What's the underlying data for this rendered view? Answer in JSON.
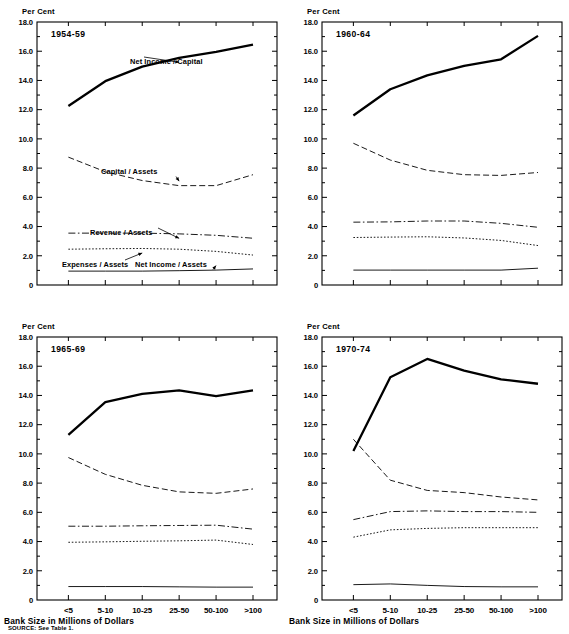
{
  "figure": {
    "axis_unit_label": "Per Cent",
    "x_axis_title": "Bank Size in Millions of Dollars",
    "source_note": "SOURCE: See Table 1."
  },
  "chart_data": [
    {
      "type": "line",
      "title": "1954-59",
      "xlabel": "Bank Size in Millions of Dollars",
      "ylabel": "Per Cent",
      "categories": [
        "<5",
        "5-10",
        "10-25",
        "25-50",
        "50-100",
        ">100"
      ],
      "ylim": [
        0,
        18
      ],
      "yticks": [
        "0",
        "2.0",
        "4.0",
        "6.0",
        "8.0",
        "10.0",
        "12.0",
        "14.0",
        "16.0",
        "18.0"
      ],
      "grid": false,
      "legend": "inline-annotations",
      "series": [
        {
          "name": "Net Income / Capital",
          "style": "solid-thick",
          "values": [
            12.25,
            13.95,
            14.95,
            15.55,
            15.95,
            16.45
          ]
        },
        {
          "name": "Capital / Assets",
          "style": "dashed",
          "values": [
            8.75,
            7.75,
            7.15,
            6.8,
            6.8,
            7.55
          ]
        },
        {
          "name": "Revenue / Assets",
          "style": "dash-dot",
          "values": [
            3.55,
            3.55,
            3.55,
            3.5,
            3.4,
            3.2
          ]
        },
        {
          "name": "Expenses / Assets",
          "style": "dotted",
          "values": [
            2.45,
            2.48,
            2.5,
            2.45,
            2.3,
            2.05
          ]
        },
        {
          "name": "Net Income / Assets",
          "style": "solid-thin",
          "values": [
            0.95,
            0.95,
            0.95,
            0.98,
            1.02,
            1.1
          ]
        }
      ],
      "annotations": [
        {
          "label": "Net Income / Capital",
          "target_category": "25-50"
        },
        {
          "label": "Capital / Assets",
          "target_category": "25-50"
        },
        {
          "label": "Revenue / Assets",
          "target_category": "25-50"
        },
        {
          "label": "Expenses / Assets",
          "target_category": "10-25"
        },
        {
          "label": "Net Income / Assets",
          "target_category": "50-100"
        }
      ]
    },
    {
      "type": "line",
      "title": "1960-64",
      "xlabel": "Bank Size in Millions of Dollars",
      "ylabel": "Per Cent",
      "categories": [
        "<5",
        "5-10",
        "10-25",
        "25-50",
        "50-100",
        ">100"
      ],
      "ylim": [
        0,
        18
      ],
      "yticks": [
        "0",
        "2.0",
        "4.0",
        "6.0",
        "8.0",
        "10.0",
        "12.0",
        "14.0",
        "16.0",
        "18.0"
      ],
      "grid": false,
      "series": [
        {
          "name": "Net Income / Capital",
          "style": "solid-thick",
          "values": [
            11.6,
            13.4,
            14.35,
            15.0,
            15.45,
            17.05
          ]
        },
        {
          "name": "Capital / Assets",
          "style": "dashed",
          "values": [
            9.7,
            8.55,
            7.85,
            7.55,
            7.5,
            7.7
          ]
        },
        {
          "name": "Revenue / Assets",
          "style": "dash-dot",
          "values": [
            4.3,
            4.32,
            4.38,
            4.38,
            4.22,
            3.95
          ]
        },
        {
          "name": "Expenses / Assets",
          "style": "dotted",
          "values": [
            3.25,
            3.28,
            3.3,
            3.22,
            3.05,
            2.7
          ]
        },
        {
          "name": "Net Income / Assets",
          "style": "solid-thin",
          "values": [
            1.02,
            1.02,
            1.02,
            1.02,
            1.02,
            1.15
          ]
        }
      ],
      "annotations": []
    },
    {
      "type": "line",
      "title": "1965-69",
      "xlabel": "Bank Size in Millions of Dollars",
      "ylabel": "Per Cent",
      "categories": [
        "<5",
        "5-10",
        "10-25",
        "25-50",
        "50-100",
        ">100"
      ],
      "ylim": [
        0,
        18
      ],
      "yticks": [
        "0",
        "2.0",
        "4.0",
        "6.0",
        "8.0",
        "10.0",
        "12.0",
        "14.0",
        "16.0",
        "18.0"
      ],
      "grid": false,
      "series": [
        {
          "name": "Net Income / Capital",
          "style": "solid-thick",
          "values": [
            11.3,
            13.55,
            14.1,
            14.35,
            13.95,
            14.35
          ]
        },
        {
          "name": "Capital / Assets",
          "style": "dashed",
          "values": [
            9.75,
            8.6,
            7.85,
            7.4,
            7.3,
            7.6
          ]
        },
        {
          "name": "Revenue / Assets",
          "style": "dash-dot",
          "values": [
            5.05,
            5.05,
            5.08,
            5.1,
            5.12,
            4.85
          ]
        },
        {
          "name": "Expenses / Assets",
          "style": "dotted",
          "values": [
            3.95,
            3.98,
            4.02,
            4.05,
            4.1,
            3.8
          ]
        },
        {
          "name": "Net Income / Assets",
          "style": "solid-thin",
          "values": [
            0.92,
            0.92,
            0.92,
            0.9,
            0.88,
            0.88
          ]
        }
      ],
      "annotations": []
    },
    {
      "type": "line",
      "title": "1970-74",
      "xlabel": "Bank Size in Millions of Dollars",
      "ylabel": "Per Cent",
      "categories": [
        "<5",
        "5-10",
        "10-25",
        "25-50",
        "50-100",
        ">100"
      ],
      "ylim": [
        0,
        18
      ],
      "yticks": [
        "0",
        "2.0",
        "4.0",
        "6.0",
        "8.0",
        "10.0",
        "12.0",
        "14.0",
        "16.0",
        "18.0"
      ],
      "grid": false,
      "series": [
        {
          "name": "Net Income / Capital",
          "style": "solid-thick",
          "values": [
            10.2,
            15.25,
            16.5,
            15.7,
            15.1,
            14.8
          ]
        },
        {
          "name": "Capital / Assets",
          "style": "dashed",
          "values": [
            11.0,
            8.2,
            7.5,
            7.35,
            7.05,
            6.85
          ]
        },
        {
          "name": "Revenue / Assets",
          "style": "dash-dot",
          "values": [
            5.5,
            6.05,
            6.1,
            6.05,
            6.05,
            6.0
          ]
        },
        {
          "name": "Expenses / Assets",
          "style": "dotted",
          "values": [
            4.3,
            4.8,
            4.9,
            4.95,
            4.95,
            4.95
          ]
        },
        {
          "name": "Net Income / Assets",
          "style": "solid-thin",
          "values": [
            1.05,
            1.1,
            1.0,
            0.92,
            0.9,
            0.9
          ]
        }
      ],
      "annotations": []
    }
  ]
}
